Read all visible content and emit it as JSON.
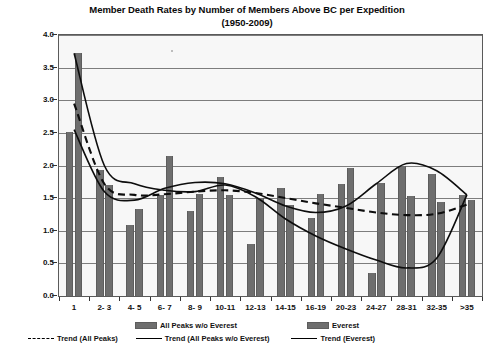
{
  "chart_data": {
    "type": "bar",
    "title": "Member Death Rates by Number of Members Above BC per Expedition",
    "subtitle": "(1950-2009)",
    "xlabel": "",
    "ylabel": "",
    "ylim": [
      0.0,
      4.0
    ],
    "ytick_step": 0.5,
    "ytick_labels": [
      "0.0",
      "0.5",
      "1.0",
      "1.5",
      "2.0",
      "2.5",
      "3.0",
      "3.5",
      "4.0"
    ],
    "grid": true,
    "legend_position": "bottom",
    "categories": [
      "1",
      "2- 3",
      "4- 5",
      "6- 7",
      "8- 9",
      "10-11",
      "12-13",
      "14-15",
      "16-19",
      "20-23",
      "24-27",
      "28-31",
      "32-35",
      ">35"
    ],
    "series": [
      {
        "name": "All Peaks w/o Everest",
        "type": "bar",
        "color": "#6e6e6e",
        "values": [
          2.52,
          1.93,
          1.09,
          1.55,
          1.31,
          1.83,
          0.8,
          1.65,
          1.2,
          1.71,
          0.36,
          2.0,
          1.87,
          1.55
        ]
      },
      {
        "name": "Everest",
        "type": "bar",
        "color": "#6e6e6e",
        "values": [
          3.72,
          1.7,
          1.34,
          2.14,
          1.56,
          1.55,
          1.5,
          1.4,
          1.57,
          1.96,
          1.73,
          1.54,
          1.44,
          1.47
        ]
      },
      {
        "name": "Trend (All Peaks)",
        "type": "line",
        "style": "dashed",
        "color": "#0d0d0d",
        "values": [
          2.95,
          1.72,
          1.55,
          1.56,
          1.6,
          1.62,
          1.58,
          1.5,
          1.42,
          1.35,
          1.28,
          1.24,
          1.26,
          1.4
        ]
      },
      {
        "name": "Trend (All Peaks w/o Everest)",
        "type": "line",
        "style": "solid",
        "color": "#0d0d0d",
        "values": [
          2.55,
          1.6,
          1.47,
          1.65,
          1.74,
          1.72,
          1.58,
          1.38,
          1.28,
          1.38,
          1.72,
          2.03,
          1.92,
          1.55
        ]
      },
      {
        "name": "Trend (Everest)",
        "type": "line",
        "style": "solid",
        "color": "#0d0d0d",
        "values": [
          3.72,
          2.0,
          1.72,
          1.62,
          1.6,
          1.7,
          1.52,
          1.18,
          0.92,
          0.72,
          0.55,
          0.43,
          0.58,
          1.55
        ]
      }
    ],
    "legend": [
      {
        "label": "All Peaks w/o Everest",
        "marker": "bar-swatch"
      },
      {
        "label": "Everest",
        "marker": "bar-swatch"
      },
      {
        "label": "Trend (All Peaks)",
        "marker": "dashed-line"
      },
      {
        "label": "Trend (All Peaks w/o Everest)",
        "marker": "solid-line"
      },
      {
        "label": "Trend (Everest)",
        "marker": "solid-line"
      }
    ],
    "colors": {
      "bar_fill": "#6e6e6e",
      "plot_background": "#f7f7f7",
      "gridline": "#7d7d7d",
      "axis": "#5a5a5a",
      "trend_line": "#0d0d0d"
    }
  }
}
